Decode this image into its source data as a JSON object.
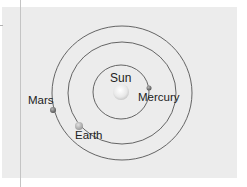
{
  "diagram": {
    "colors": {
      "panel_bg": "#ececec",
      "orbit_stroke": "#555555",
      "sun": "#f4f4f4",
      "planet": "#8a8a8a",
      "text": "#222222"
    },
    "sun": {
      "label": "Sun"
    },
    "planets": [
      {
        "name": "Mercury",
        "label": "Mercury"
      },
      {
        "name": "Earth",
        "label": "Earth"
      },
      {
        "name": "Mars",
        "label": "Mars"
      }
    ]
  }
}
